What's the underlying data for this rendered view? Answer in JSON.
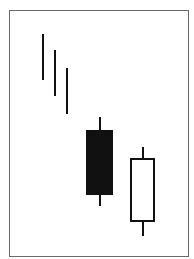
{
  "chart_data": {
    "type": "candlestick",
    "title": "",
    "xlabel": "",
    "ylabel": "",
    "grid": false,
    "legend": null,
    "note": "No axes or labels are shown; values are pixel-based relative prices (higher = higher price), on a 0-100 scale.",
    "ylim": [
      0,
      100
    ],
    "candles": [
      {
        "index": 1,
        "kind": "line",
        "high": 94,
        "low": 74,
        "color": "#111111"
      },
      {
        "index": 2,
        "kind": "line",
        "high": 87,
        "low": 67,
        "color": "#111111"
      },
      {
        "index": 3,
        "kind": "line",
        "high": 79,
        "low": 59,
        "color": "#111111"
      },
      {
        "index": 4,
        "kind": "candle",
        "open": 52,
        "close": 24,
        "high": 58,
        "low": 19,
        "direction": "bearish",
        "fill": "#111111"
      },
      {
        "index": 5,
        "kind": "candle",
        "open": 12,
        "close": 40,
        "high": 45,
        "low": 6,
        "direction": "bullish",
        "fill": "#ffffff"
      }
    ]
  },
  "colors": {
    "frame": "#6a6a6a",
    "ink": "#111111",
    "background": "#ffffff"
  }
}
